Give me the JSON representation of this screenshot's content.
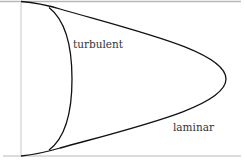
{
  "diagram": {
    "type": "velocity-profile",
    "labels": {
      "turbulent": "turbulent",
      "laminar": "laminar"
    },
    "colors": {
      "wall": "#b8b8b8",
      "curve": "#111111",
      "text": "#333333",
      "background": "#ffffff"
    }
  }
}
